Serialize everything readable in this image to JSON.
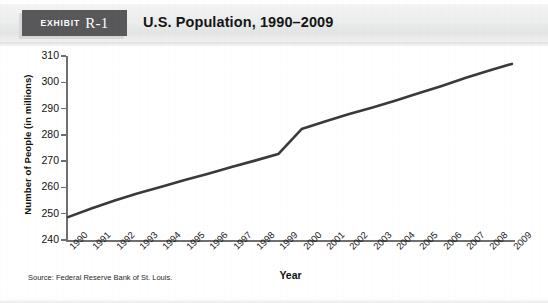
{
  "exhibit": {
    "badge_word": "Exhibit",
    "badge_number": "R-1",
    "title": "U.S. Population, 1990–2009"
  },
  "source_note": "Source: Federal Reserve Bank of St. Louis.",
  "chart_data": {
    "type": "line",
    "title": "U.S. Population, 1990–2009",
    "xlabel": "Year",
    "ylabel": "Number of People (in millions)",
    "categories": [
      "1990",
      "1991",
      "1992",
      "1993",
      "1994",
      "1995",
      "1996",
      "1997",
      "1998",
      "1999",
      "2000",
      "2001",
      "2002",
      "2003",
      "2004",
      "2005",
      "2006",
      "2007",
      "2008",
      "2009"
    ],
    "values": [
      248.7,
      252.0,
      255.0,
      257.8,
      260.3,
      262.8,
      265.2,
      267.8,
      270.2,
      272.7,
      282.2,
      285.1,
      287.8,
      290.3,
      293.0,
      295.8,
      298.6,
      301.6,
      304.4,
      307.0
    ],
    "ylim": [
      240,
      310
    ],
    "yticks": [
      240,
      250,
      260,
      270,
      280,
      290,
      300,
      310
    ],
    "grid": false,
    "legend": false,
    "series_color": "#3a3a3a"
  }
}
